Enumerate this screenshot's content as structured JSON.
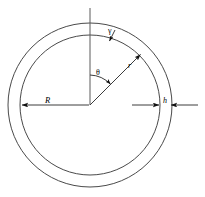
{
  "figure": {
    "background_color": "#ffffff",
    "stroke_color": "#3c3c3c",
    "label_color": "#000000",
    "width": 205,
    "height": 197
  },
  "geometry": {
    "center_x": 90,
    "center_y": 105,
    "inner_radius": 70,
    "outer_radius": 82,
    "wall_thickness": 12,
    "axis_top_y": 8,
    "radial_angle_deg": 45,
    "theta_arc_radius": 30
  },
  "labels": {
    "outer_radius_label": "R",
    "radial_coordinate_label": "r",
    "thickness_label": "h",
    "gamma_label": "γ",
    "theta_label": "θ"
  },
  "annotations": {
    "vertical_axis": "vertical reference axis",
    "theta_arc": "angle measured from vertical axis to radial line",
    "radius_arrow": "arrow from center toward inner circle at 45 degrees",
    "R_dimension": "left-pointing dimension arrow from center to inner circle",
    "h_dimension": "opposing arrows spanning the annulus wall thickness"
  }
}
